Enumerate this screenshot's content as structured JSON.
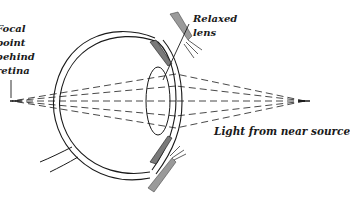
{
  "diagram": {
    "labels": {
      "focal_point": [
        "Focal",
        "point",
        "behind",
        "retina"
      ],
      "relaxed_lens": [
        "Relaxed",
        "lens"
      ],
      "light_source": "Light from near source"
    },
    "colors": {
      "line": "#1a1a1a",
      "muscle_shade": "#8a8a8a",
      "background": "#ffffff"
    }
  }
}
